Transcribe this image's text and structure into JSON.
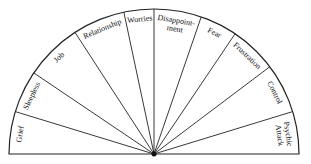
{
  "diagram": {
    "type": "semicircle-pendulum-chart",
    "center": [
      154,
      154
    ],
    "radius": 145,
    "stroke_color": "#222222",
    "background": "#ffffff",
    "spoke_angles_deg": [
      180,
      163,
      146,
      123,
      102,
      90,
      71,
      56,
      37,
      17,
      0
    ],
    "segments": [
      {
        "label": "Grief",
        "lines": [
          "Grief"
        ]
      },
      {
        "label": "Sleepless",
        "lines": [
          "Sleepless"
        ]
      },
      {
        "label": "Job",
        "lines": [
          "Job"
        ]
      },
      {
        "label": "Relationship",
        "lines": [
          "Relationship"
        ]
      },
      {
        "label": "Worries",
        "lines": [
          "Worries"
        ]
      },
      {
        "label": "Disappointment",
        "lines": [
          "Disappoint-",
          "ment"
        ]
      },
      {
        "label": "Fear",
        "lines": [
          "Fear"
        ]
      },
      {
        "label": "Frustration",
        "lines": [
          "Frustration"
        ]
      },
      {
        "label": "Control",
        "lines": [
          "Control"
        ]
      },
      {
        "label": "Psychic Attack",
        "lines": [
          "Psychic",
          "Attack"
        ]
      }
    ]
  }
}
